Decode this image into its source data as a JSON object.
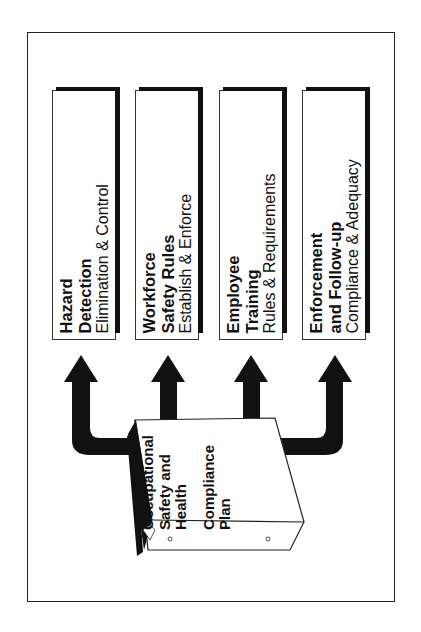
{
  "diagram": {
    "type": "flow",
    "orientation": "rotated-90",
    "source": {
      "label_lines": [
        "Occupational",
        "Safety and",
        "Health",
        "Compliance",
        "Plan"
      ],
      "icon": "binder-icon"
    },
    "targets": [
      {
        "title_lines": [
          "Hazard",
          "Detection"
        ],
        "subtitle": "Elimination & Control",
        "icon": "magnifying-glass-icon"
      },
      {
        "title_lines": [
          "Workforce",
          "Safety Rules"
        ],
        "subtitle": "Establish & Enforce",
        "icon": "rule-books-icon"
      },
      {
        "title_lines": [
          "Employee",
          "Training"
        ],
        "subtitle": "Rules & Requirements",
        "icon": "classroom-icon"
      },
      {
        "title_lines": [
          "Enforcement",
          "and Follow-up"
        ],
        "subtitle": "Compliance & Adequacy",
        "icon": "scales-icon"
      }
    ],
    "edges": [
      {
        "from": "Compliance Plan",
        "to": "Hazard Detection"
      },
      {
        "from": "Compliance Plan",
        "to": "Workforce Safety Rules"
      },
      {
        "from": "Compliance Plan",
        "to": "Employee Training"
      },
      {
        "from": "Compliance Plan",
        "to": "Enforcement and Follow-up"
      }
    ],
    "colors": {
      "ink": "#111111",
      "background": "#ffffff"
    }
  }
}
